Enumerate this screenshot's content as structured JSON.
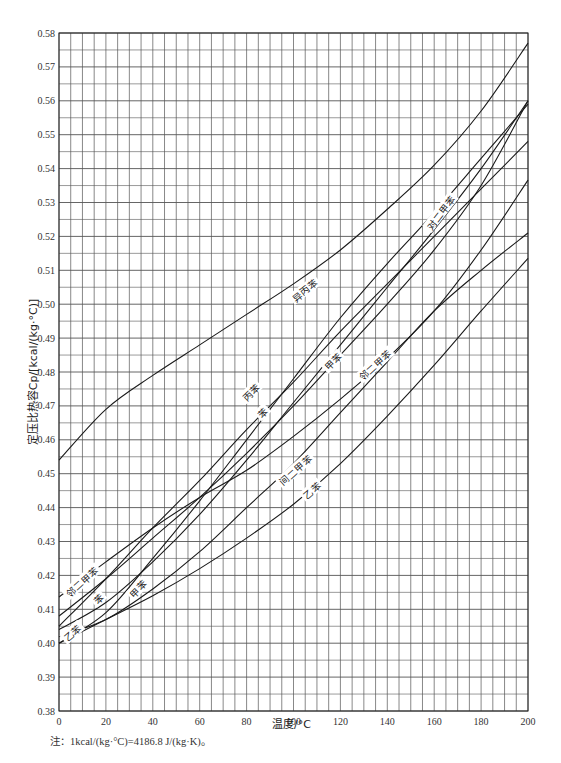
{
  "chart_data": {
    "type": "line",
    "title": "",
    "xlabel": "温度/°C",
    "ylabel": "定压比热容Cp/[kcal/(kg·°C)]",
    "xlim": [
      0,
      200
    ],
    "ylim": [
      0.38,
      0.58
    ],
    "grid": true,
    "grid_x_step": 5,
    "grid_y_step": 0.005,
    "x_ticks": [
      0,
      20,
      40,
      60,
      80,
      100,
      120,
      140,
      160,
      180,
      200
    ],
    "y_ticks": [
      0.38,
      0.39,
      0.4,
      0.41,
      0.42,
      0.43,
      0.44,
      0.45,
      0.46,
      0.47,
      0.48,
      0.49,
      0.5,
      0.51,
      0.52,
      0.53,
      0.54,
      0.55,
      0.56,
      0.57,
      0.58
    ],
    "x": [
      0,
      20,
      40,
      60,
      80,
      100,
      120,
      140,
      160,
      180,
      200
    ],
    "series": [
      {
        "name": "异丙苯",
        "values": [
          0.454,
          0.469,
          0.479,
          0.488,
          0.497,
          0.506,
          0.516,
          0.528,
          0.541,
          0.557,
          0.577
        ],
        "label_at": [
          105,
          0.504
        ],
        "label_angle": -38
      },
      {
        "name": "对二甲苯",
        "values": [
          0.4,
          0.409,
          0.425,
          0.442,
          0.46,
          0.478,
          0.496,
          0.512,
          0.527,
          0.543,
          0.559
        ],
        "label_at": [
          163,
          0.527
        ],
        "label_angle": -52
      },
      {
        "name": "甲苯",
        "values": [
          0.404,
          0.412,
          0.424,
          0.438,
          0.454,
          0.471,
          0.488,
          0.505,
          0.522,
          0.54,
          0.56
        ],
        "label_at": [
          34,
          0.416,
          117,
          0.483
        ],
        "label_angle": -45
      },
      {
        "name": "丙苯",
        "values": [
          0.405,
          0.419,
          0.434,
          0.448,
          0.463,
          0.477,
          0.492,
          0.506,
          0.52,
          0.534,
          0.548
        ],
        "label_at": [
          82,
          0.474
        ],
        "label_angle": -45
      },
      {
        "name": "苯",
        "values": [
          0.408,
          0.419,
          0.431,
          0.443,
          0.456,
          0.47,
          0.485,
          0.5,
          0.516,
          0.535,
          0.56
        ],
        "label_at": [
          87,
          0.468,
          17,
          0.413
        ],
        "label_angle": -45
      },
      {
        "name": "邻二甲苯",
        "values": [
          0.4136,
          0.424,
          0.434,
          0.443,
          0.451,
          0.461,
          0.472,
          0.484,
          0.498,
          0.516,
          0.5366
        ],
        "label_at": [
          135,
          0.482,
          10,
          0.418
        ],
        "label_angle": -42
      },
      {
        "name": "间二甲苯",
        "values": [
          0.402,
          0.407,
          0.416,
          0.427,
          0.44,
          0.453,
          0.468,
          0.483,
          0.498,
          0.51,
          0.521
        ],
        "label_at": [
          101,
          0.451
        ],
        "label_angle": -42
      },
      {
        "name": "乙苯",
        "values": [
          0.4,
          0.407,
          0.414,
          0.422,
          0.431,
          0.441,
          0.453,
          0.467,
          0.482,
          0.498,
          0.5135
        ],
        "label_at": [
          108,
          0.445,
          6,
          0.403
        ],
        "label_angle": -42
      }
    ]
  },
  "labels": {
    "isopropylbenzene": "异丙苯",
    "p_xylene": "对二甲苯",
    "toluene": "甲苯",
    "propylbenzene": "丙苯",
    "benzene": "苯",
    "o_xylene": "邻二甲苯",
    "m_xylene": "间二甲苯",
    "ethylbenzene": "乙苯"
  },
  "axes": {
    "xlabel": "温度/°C",
    "ylabel": "定压比热容Cp/[kcal/(kg·°C)]"
  },
  "footnote": "注：1kcal/(kg·°C)=4186.8 J/(kg·K)。",
  "colors": {
    "line": "#1a1a1a",
    "grid": "#555555",
    "background": "#ffffff"
  }
}
